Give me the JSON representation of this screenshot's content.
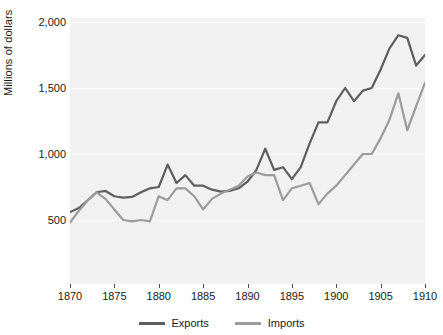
{
  "chart_data": {
    "type": "line",
    "title": "",
    "subtitle": "",
    "xlabel": "",
    "ylabel": "Millions of dollars",
    "xlim": [
      1870,
      1910
    ],
    "ylim": [
      0,
      2100
    ],
    "grid": true,
    "gridlines_y": [
      500,
      1000,
      1500,
      2000
    ],
    "legend_position": "bottom-center",
    "x_tick_labels": [
      "1870",
      "1875",
      "1880",
      "1885",
      "1890",
      "1895",
      "1900",
      "1905",
      "1910"
    ],
    "x_ticks": [
      1870,
      1875,
      1880,
      1885,
      1890,
      1895,
      1900,
      1905,
      1910
    ],
    "y_tick_labels": [
      "500",
      "1,000",
      "1,500",
      "2,000"
    ],
    "y_ticks": [
      500,
      1000,
      1500,
      2000
    ],
    "x": [
      1870,
      1871,
      1872,
      1873,
      1874,
      1875,
      1876,
      1877,
      1878,
      1879,
      1880,
      1881,
      1882,
      1883,
      1884,
      1885,
      1886,
      1887,
      1888,
      1889,
      1890,
      1891,
      1892,
      1893,
      1894,
      1895,
      1896,
      1897,
      1898,
      1899,
      1900,
      1901,
      1902,
      1903,
      1904,
      1905,
      1906,
      1907,
      1908,
      1909,
      1910
    ],
    "series": [
      {
        "name": "Exports",
        "color": "#5e5e5e",
        "values": [
          560,
          590,
          650,
          710,
          720,
          680,
          670,
          675,
          710,
          740,
          750,
          920,
          780,
          840,
          760,
          760,
          730,
          715,
          720,
          740,
          790,
          880,
          1040,
          880,
          900,
          810,
          900,
          1080,
          1240,
          1240,
          1400,
          1500,
          1400,
          1480,
          1500,
          1640,
          1800,
          1900,
          1880,
          1670,
          1750
        ]
      },
      {
        "name": "Imports",
        "color": "#9b9b9b",
        "values": [
          480,
          570,
          650,
          710,
          660,
          580,
          500,
          490,
          500,
          490,
          680,
          650,
          740,
          740,
          680,
          580,
          660,
          700,
          730,
          760,
          830,
          860,
          840,
          840,
          650,
          740,
          760,
          780,
          620,
          700,
          760,
          840,
          920,
          1000,
          1000,
          1120,
          1260,
          1460,
          1180,
          1360,
          1540
        ]
      }
    ]
  },
  "legend": {
    "entries": [
      {
        "label": "Exports",
        "color": "#5e5e5e"
      },
      {
        "label": "Imports",
        "color": "#9b9b9b"
      }
    ]
  },
  "axes": {
    "y_title": "Millions of dollars"
  },
  "colors": {
    "exports": "#5e5e5e",
    "imports": "#9b9b9b",
    "plot_background": "#f1f1f1",
    "gridline": "#ffffff",
    "text": "#1a1a1a"
  }
}
